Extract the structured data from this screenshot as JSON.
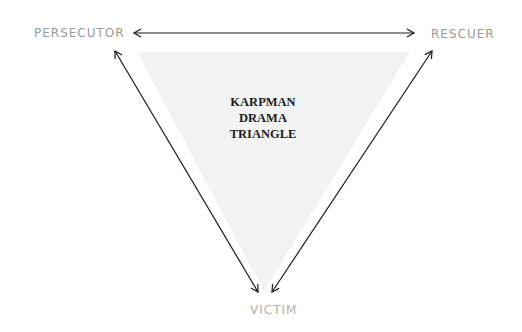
{
  "diagram": {
    "title_lines": [
      "KARPMAN",
      "DRAMA",
      "TRIANGLE"
    ],
    "roles": {
      "top_left": "PERSECUTOR",
      "top_right": "RESCUER",
      "bottom": "VICTIM"
    },
    "connections": [
      {
        "from": "PERSECUTOR",
        "to": "RESCUER",
        "direction": "bidirectional"
      },
      {
        "from": "PERSECUTOR",
        "to": "VICTIM",
        "direction": "bidirectional"
      },
      {
        "from": "RESCUER",
        "to": "VICTIM",
        "direction": "bidirectional"
      }
    ],
    "colors": {
      "triangle_fill": "#f3f3f3",
      "arrow": "#1a1a1a",
      "label": "#9a9a9a",
      "title": "#1e1e1e"
    }
  }
}
